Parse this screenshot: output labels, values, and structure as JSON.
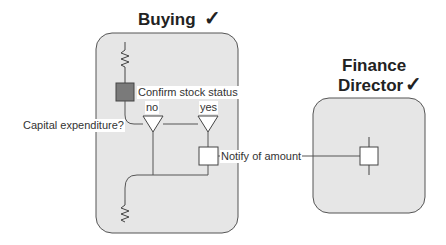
{
  "lanes": [
    {
      "title": "Buying",
      "check": "✓"
    },
    {
      "title_line1": "Finance",
      "title_line2": "Director",
      "check": "✓"
    }
  ],
  "labels": {
    "confirm": "Confirm stock status",
    "no": "no",
    "yes": "yes",
    "question": "Capital expenditure?",
    "notify": "Notify of amount"
  },
  "colors": {
    "lane_fill": "#e6e6e6",
    "lane_stroke": "#555555",
    "task_filled": "#7a7a7a",
    "line": "#555555"
  }
}
